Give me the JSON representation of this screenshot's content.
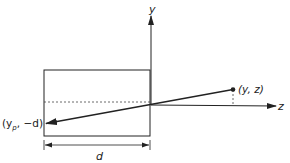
{
  "diagram": {
    "axes": {
      "y_label": "y",
      "z_label": "z"
    },
    "point": {
      "label": "(y, z)"
    },
    "projected_point": {
      "label_main": "(y",
      "label_sub": "p",
      "label_rest": ", −d)"
    },
    "dimension": {
      "label": "d"
    },
    "colors": {
      "stroke": "#222222",
      "background": "#ffffff"
    }
  }
}
